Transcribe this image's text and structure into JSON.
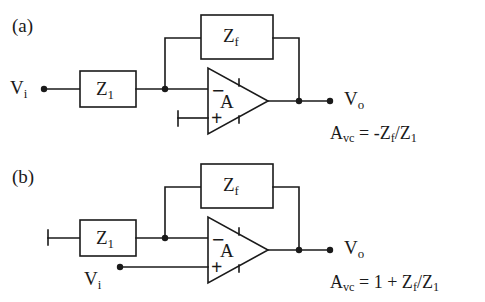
{
  "figure": {
    "background_color": "#ffffff",
    "line_color": "#1a1a1a",
    "panels": [
      {
        "tag": "(a)",
        "name": "inverting-amplifier",
        "input_label_v": "V",
        "input_label_sub": "i",
        "output_label_v": "V",
        "output_label_sub": "o",
        "series_impedance": {
          "v": "Z",
          "sub": "1"
        },
        "feedback_impedance": {
          "v": "Z",
          "sub": "f"
        },
        "amp_label": "A",
        "inverting_sign": "−",
        "noninverting_sign": "+",
        "input_terminal": "signal-source-dot",
        "noninverting_terminal": "ground-bar",
        "equation": {
          "lhs_v": "A",
          "lhs_sub": "vc",
          "equals": "=",
          "rhs": "-Z",
          "rhs_sub1": "f",
          "rhs_slash": "/Z",
          "rhs_sub2": "1",
          "plain": "A_vc = -Z_f /Z_1"
        }
      },
      {
        "tag": "(b)",
        "name": "noninverting-amplifier",
        "input_label_v": "V",
        "input_label_sub": "i",
        "output_label_v": "V",
        "output_label_sub": "o",
        "series_impedance": {
          "v": "Z",
          "sub": "1"
        },
        "feedback_impedance": {
          "v": "Z",
          "sub": "f"
        },
        "amp_label": "A",
        "inverting_sign": "−",
        "noninverting_sign": "+",
        "input_terminal": "signal-source-dot",
        "series_left_terminal": "ground-bar",
        "equation": {
          "lhs_v": "A",
          "lhs_sub": "vc",
          "equals": "=",
          "rhs": "1 + Z",
          "rhs_sub1": "f",
          "rhs_slash": "/Z",
          "rhs_sub2": "1",
          "plain": "A_vc = 1 + Z_f /Z_1"
        }
      }
    ]
  }
}
